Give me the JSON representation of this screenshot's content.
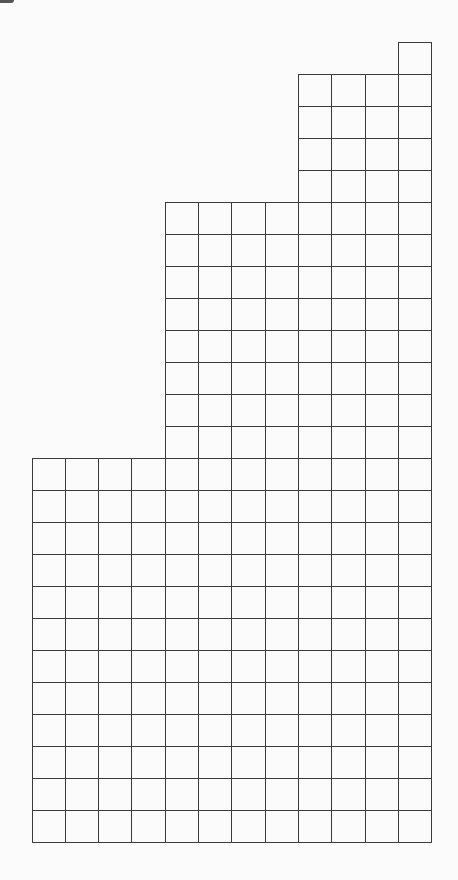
{
  "diagram": {
    "type": "staircase-grid",
    "columns": 12,
    "rows": 25,
    "origin_x": 32,
    "origin_y": 42,
    "cell_width": 33.33,
    "cell_height": 32,
    "line_color": "#3a3a3a",
    "background_color": "#fbfbfb",
    "column_heights": [
      12,
      12,
      12,
      12,
      20,
      20,
      20,
      20,
      24,
      24,
      24,
      25
    ],
    "column_groups": [
      {
        "name": "group-a",
        "columns": [
          0,
          1,
          2,
          3
        ],
        "height_in_cells": 12
      },
      {
        "name": "group-b",
        "columns": [
          4,
          5,
          6,
          7
        ],
        "height_in_cells": 20
      },
      {
        "name": "group-c",
        "columns": [
          8,
          9,
          10
        ],
        "height_in_cells": 24
      },
      {
        "name": "group-d",
        "columns": [
          11
        ],
        "height_in_cells": 25
      }
    ],
    "total_cells": 262
  }
}
